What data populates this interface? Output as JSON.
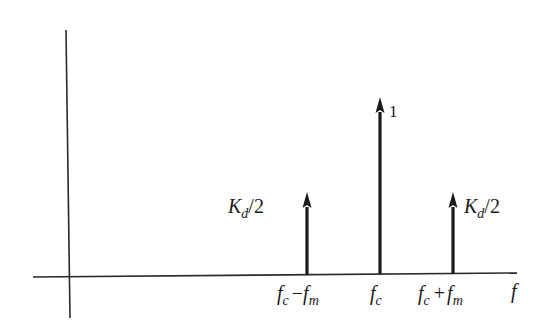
{
  "figure": {
    "type": "spectrum-diagram",
    "axis": {
      "x_label": "f"
    },
    "impulses": [
      {
        "position_label_main": "f",
        "position_label_sub": "c",
        "op": "−",
        "position_label_main2": "f",
        "position_label_sub2": "m",
        "amplitude_main": "K",
        "amplitude_sub": "d",
        "amplitude_suffix": "/2",
        "relative_height": 0.5
      },
      {
        "position_label_main": "f",
        "position_label_sub": "c",
        "amplitude_main": "1",
        "relative_height": 1.0
      },
      {
        "position_label_main": "f",
        "position_label_sub": "c",
        "op": "+",
        "position_label_main2": "f",
        "position_label_sub2": "m",
        "amplitude_main": "K",
        "amplitude_sub": "d",
        "amplitude_suffix": "/2",
        "relative_height": 0.5
      }
    ],
    "colors": {
      "ink": "#1a1a1a",
      "background": "#ffffff"
    }
  }
}
